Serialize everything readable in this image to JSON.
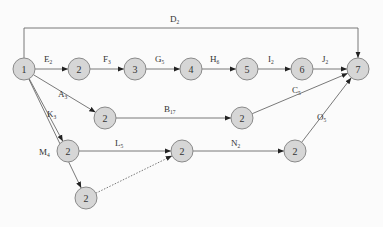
{
  "diagram": {
    "type": "activity-network",
    "nodes": [
      {
        "id": "n1",
        "label": "1"
      },
      {
        "id": "n2a",
        "label": "2"
      },
      {
        "id": "n3",
        "label": "3"
      },
      {
        "id": "n4",
        "label": "4"
      },
      {
        "id": "n5",
        "label": "5"
      },
      {
        "id": "n6",
        "label": "6"
      },
      {
        "id": "n7",
        "label": "7"
      },
      {
        "id": "n2b",
        "label": "2"
      },
      {
        "id": "n2c",
        "label": "2"
      },
      {
        "id": "n2d",
        "label": "2"
      },
      {
        "id": "n2e",
        "label": "2"
      },
      {
        "id": "n2f",
        "label": "2"
      },
      {
        "id": "n2g",
        "label": "2"
      }
    ],
    "edges": [
      {
        "from": "n1",
        "to": "n7",
        "letter": "D",
        "sub": "2",
        "route": "top"
      },
      {
        "from": "n1",
        "to": "n2a",
        "letter": "E",
        "sub": "2"
      },
      {
        "from": "n2a",
        "to": "n3",
        "letter": "F",
        "sub": "3"
      },
      {
        "from": "n3",
        "to": "n4",
        "letter": "G",
        "sub": "5"
      },
      {
        "from": "n4",
        "to": "n5",
        "letter": "H",
        "sub": "6"
      },
      {
        "from": "n5",
        "to": "n6",
        "letter": "I",
        "sub": "2"
      },
      {
        "from": "n6",
        "to": "n7",
        "letter": "J",
        "sub": "2"
      },
      {
        "from": "n1",
        "to": "n2b",
        "letter": "A",
        "sub": "3"
      },
      {
        "from": "n2b",
        "to": "n2c",
        "letter": "B",
        "sub": "17"
      },
      {
        "from": "n2c",
        "to": "n7",
        "letter": "C",
        "sub": "5"
      },
      {
        "from": "n1",
        "to": "n2d",
        "letter": "K",
        "sub": "3"
      },
      {
        "from": "n2d",
        "to": "n2e",
        "letter": "L",
        "sub": "5"
      },
      {
        "from": "n2e",
        "to": "n2f",
        "letter": "N",
        "sub": "2"
      },
      {
        "from": "n2f",
        "to": "n7",
        "letter": "O",
        "sub": "5"
      },
      {
        "from": "n1",
        "to": "n2g",
        "letter": "M",
        "sub": "4"
      },
      {
        "from": "n2g",
        "to": "n2e",
        "letter": "",
        "sub": "",
        "dashed": true
      }
    ]
  }
}
